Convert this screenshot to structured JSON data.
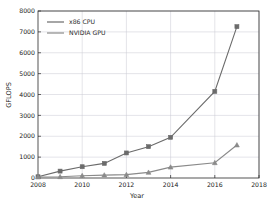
{
  "chart_data": {
    "type": "line",
    "title": "",
    "xlabel": "Year",
    "ylabel": "GFLOPS",
    "xlim": [
      2008,
      2018
    ],
    "ylim": [
      0,
      8000
    ],
    "grid": true,
    "legend_position": "upper left",
    "x": [
      2008,
      2009,
      2010,
      2011,
      2012,
      2013,
      2014,
      2016,
      2017
    ],
    "xticks": [
      2008,
      2010,
      2012,
      2014,
      2016,
      2018
    ],
    "xtick_labels": [
      "2008",
      "2010",
      "2012",
      "2014",
      "2016",
      "2018"
    ],
    "yticks": [
      0,
      1000,
      2000,
      3000,
      4000,
      5000,
      6000,
      7000,
      8000
    ],
    "ytick_labels": [
      "0",
      "1000",
      "2000",
      "3000",
      "4000",
      "5000",
      "6000",
      "7000",
      "8000"
    ],
    "series": [
      {
        "name": "x86 CPU",
        "color": "#6b6b6b",
        "marker": "square",
        "values": [
          60,
          330,
          540,
          700,
          1200,
          1500,
          1950,
          4150,
          7250
        ]
      },
      {
        "name": "NVIDIA GPU",
        "color": "#8a8a8a",
        "marker": "triangle",
        "values": [
          50,
          60,
          110,
          140,
          160,
          270,
          520,
          730,
          1580
        ]
      }
    ]
  },
  "legend": {
    "entries": [
      {
        "label": "x86 CPU"
      },
      {
        "label": "NVIDIA GPU"
      }
    ]
  },
  "colors": {
    "axis": "#2a2a2a",
    "grid": "#c8c8d2",
    "background": "#ffffff"
  }
}
